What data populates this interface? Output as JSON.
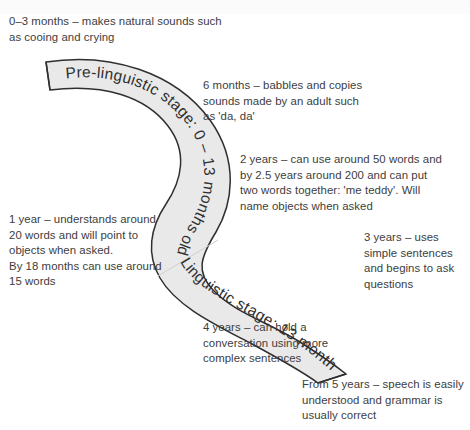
{
  "diagram": {
    "title_present": false,
    "type": "s-curve-timeline",
    "background_color": "#ffffff",
    "ribbon": {
      "fill_color": "#e9e9e9",
      "stroke_color": "#2f2f2f",
      "stages": [
        {
          "id": "pre-linguistic",
          "label": "Pre-linguistic stage: 0 – 13 months old"
        },
        {
          "id": "linguistic",
          "label": "Linguistic stage: 13 months old +"
        }
      ]
    },
    "notes": [
      {
        "id": "note-0-3",
        "text": "0–3 months – makes natural sounds such as cooing and crying"
      },
      {
        "id": "note-6mo",
        "text": "6 months – babbles and copies sounds made by an adult such as 'da, da'"
      },
      {
        "id": "note-2y",
        "text": "2 years – can use around 50 words and by 2.5 years around 200 and can put two words together: 'me teddy'. Will name objects when asked"
      },
      {
        "id": "note-1y",
        "text": "1 year – understands around 20 words and will point to objects when asked.\nBy 18 months can use around 15 words"
      },
      {
        "id": "note-3y",
        "text": "3 years – uses simple sentences and begins to ask questions"
      },
      {
        "id": "note-4y",
        "text": "4 years – can hold a conversation using more complex sentences"
      },
      {
        "id": "note-5y",
        "text": "From 5 years – speech is easily understood and grammar is usually correct"
      }
    ]
  }
}
